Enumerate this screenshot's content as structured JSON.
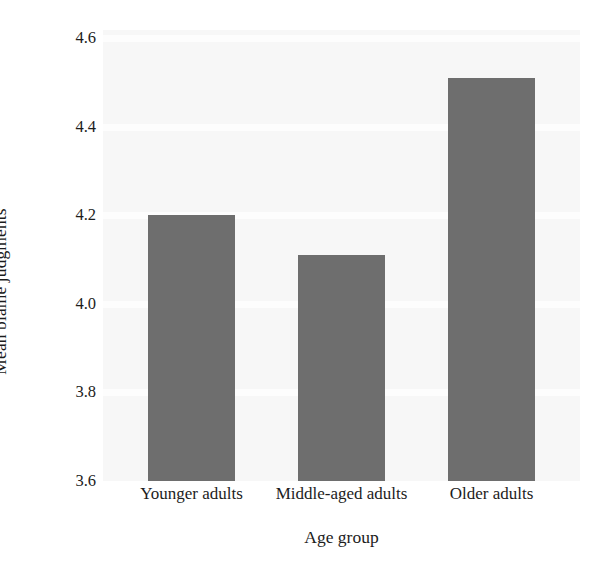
{
  "chart_data": {
    "type": "bar",
    "title": "",
    "subtitle": "",
    "xlabel": "Age group",
    "ylabel": "Mean blame judgments",
    "categories": [
      "Younger adults",
      "Middle-aged adults",
      "Older adults"
    ],
    "values": [
      4.2,
      4.11,
      4.51
    ],
    "ylim": [
      3.6,
      4.6
    ],
    "yticks": [
      "4.6",
      "4.4",
      "4.2",
      "4.0",
      "3.8",
      "3.6"
    ],
    "ytick_values": [
      4.6,
      4.4,
      4.2,
      4.0,
      3.8,
      3.6
    ],
    "grid": true,
    "legend": false,
    "legend_position": "none",
    "series": [
      {
        "name": "Mean blame judgments",
        "values": [
          4.2,
          4.11,
          4.51
        ]
      }
    ]
  },
  "style": {
    "bar_color": "#6e6e6e",
    "plot_background": "#f7f7f7",
    "gridline_color": "#fdfdfd",
    "text_color": "#1c1c1c",
    "figure_background": "#ffffff"
  }
}
